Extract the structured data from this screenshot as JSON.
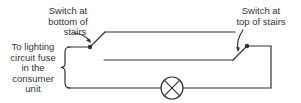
{
  "diagram": {
    "labels": {
      "bottom_switch": [
        "Switch at",
        "bottom of",
        "stairs"
      ],
      "top_switch": [
        "Switch at",
        "top of stairs"
      ],
      "fuse": [
        "To lighting",
        "circuit fuse",
        "in the",
        "consumer",
        "unit"
      ]
    },
    "components": {
      "switch_bottom": "Switch at bottom of stairs",
      "switch_top": "Switch at top of stairs",
      "lamp": "lamp",
      "supply": "To lighting circuit fuse in the consumer unit"
    },
    "colors": {
      "line": "#333333",
      "background": "#ffffff"
    }
  }
}
